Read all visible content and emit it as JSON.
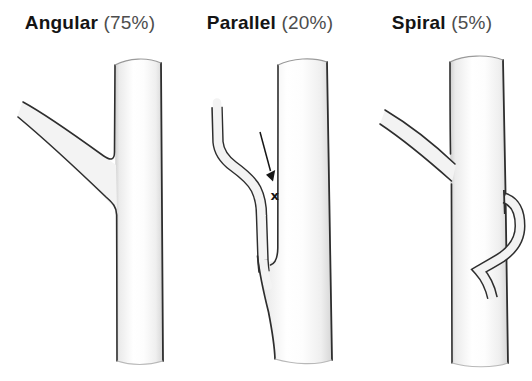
{
  "figure": {
    "panels": [
      {
        "name": "Angular",
        "percent": "(75%)"
      },
      {
        "name": "Parallel",
        "percent": "(20%)",
        "marker": "x"
      },
      {
        "name": "Spiral",
        "percent": "(5%)"
      }
    ],
    "colors": {
      "background": "#ffffff",
      "outline": "#2e2e2e",
      "vessel_fill_center": "#ffffff",
      "vessel_fill_edge": "#d6d6d6",
      "branch_fill": "#f3f3f3",
      "label_name": "#141414",
      "label_percent": "#4d4d4d",
      "annotation": "#161616"
    }
  }
}
